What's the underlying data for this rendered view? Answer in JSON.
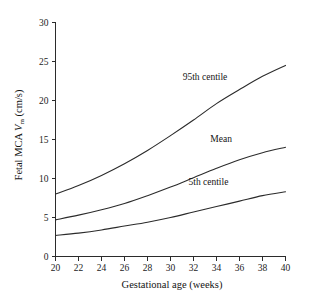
{
  "chart_data": {
    "type": "line",
    "title": "",
    "xlabel": "Gestational age (weeks)",
    "ylabel": "Fetal MCA Vₘ (cm/s)",
    "ylabel_parts": {
      "lead": "Fetal MCA ",
      "symbol": "V",
      "subscript": "m",
      "units": " (cm/s)"
    },
    "xlim": [
      20,
      40
    ],
    "ylim": [
      0,
      30
    ],
    "xticks": [
      20,
      22,
      24,
      26,
      28,
      30,
      32,
      34,
      36,
      38,
      40
    ],
    "yticks": [
      0,
      5,
      10,
      15,
      20,
      25,
      30
    ],
    "xtick_labels": [
      "20",
      "22",
      "24",
      "26",
      "28",
      "30",
      "32",
      "34",
      "36",
      "38",
      "40"
    ],
    "ytick_labels": [
      "0",
      "5",
      "10",
      "15",
      "20",
      "25",
      "30"
    ],
    "grid": false,
    "legend_position": "inline-annotations",
    "x": [
      20,
      22,
      24,
      26,
      28,
      30,
      32,
      34,
      36,
      38,
      40
    ],
    "series": [
      {
        "name": "95th centile",
        "label": "95th centile",
        "values": [
          8.0,
          9.1,
          10.4,
          11.9,
          13.6,
          15.5,
          17.5,
          19.6,
          21.4,
          23.1,
          24.5
        ],
        "annotation": {
          "text": "95th centile",
          "x": 33.0,
          "y": 22.6
        }
      },
      {
        "name": "Mean",
        "label": "Mean",
        "values": [
          4.7,
          5.3,
          6.0,
          6.8,
          7.8,
          8.9,
          10.1,
          11.3,
          12.4,
          13.3,
          14.0
        ],
        "annotation": {
          "text": "Mean",
          "x": 34.4,
          "y": 14.7
        }
      },
      {
        "name": "5th centile",
        "label": "5th centile",
        "values": [
          2.7,
          3.0,
          3.4,
          3.9,
          4.4,
          5.0,
          5.7,
          6.4,
          7.1,
          7.8,
          8.3
        ],
        "annotation": {
          "text": "5th centile",
          "x": 33.3,
          "y": 9.2
        }
      }
    ],
    "colors": {
      "curve": "#2b2b2b",
      "axis": "#2b2b2b",
      "text": "#141414",
      "background": "#ffffff"
    }
  }
}
